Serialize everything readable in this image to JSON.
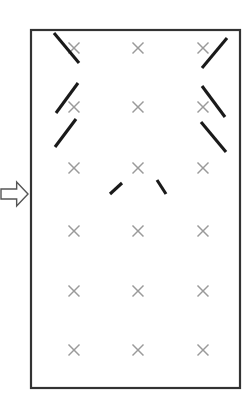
{
  "figure": {
    "title": "",
    "background_color": "#ffffff"
  },
  "frame": {
    "name": "panel-border",
    "x": 31,
    "y": 30,
    "width": 209,
    "height": 358,
    "stroke_color": "#333333",
    "fill_color": "#ffffff",
    "stroke_width": 2.2
  },
  "arrow": {
    "label": "",
    "direction": "right",
    "x": 1,
    "y": 182,
    "width": 27,
    "height": 24,
    "stroke_color": "#555555",
    "fill_color": "#ffffff"
  },
  "grid": {
    "columns": [
      74,
      138,
      203
    ],
    "rows": [
      48,
      107,
      168,
      231,
      291,
      350
    ],
    "marker_color": "#9a9a9a",
    "marker_size": 11,
    "marker_glyph": "x",
    "count": 18
  },
  "chart_data": {
    "type": "scatter",
    "title": "",
    "xlabel": "",
    "ylabel": "",
    "xlim": [
      31,
      240
    ],
    "ylim": [
      30,
      388
    ],
    "grid": false,
    "legend": "none",
    "series": [
      {
        "name": "grid-markers",
        "marker": "x",
        "color": "#9a9a9a",
        "points": [
          {
            "x": 74,
            "y": 48
          },
          {
            "x": 138,
            "y": 48
          },
          {
            "x": 203,
            "y": 48
          },
          {
            "x": 74,
            "y": 107
          },
          {
            "x": 138,
            "y": 107
          },
          {
            "x": 203,
            "y": 107
          },
          {
            "x": 74,
            "y": 168
          },
          {
            "x": 138,
            "y": 168
          },
          {
            "x": 203,
            "y": 168
          },
          {
            "x": 74,
            "y": 231
          },
          {
            "x": 138,
            "y": 231
          },
          {
            "x": 203,
            "y": 231
          },
          {
            "x": 74,
            "y": 291
          },
          {
            "x": 138,
            "y": 291
          },
          {
            "x": 203,
            "y": 291
          },
          {
            "x": 74,
            "y": 350
          },
          {
            "x": 138,
            "y": 350
          },
          {
            "x": 203,
            "y": 350
          }
        ]
      }
    ],
    "annotations": [
      {
        "name": "stroke-r1c1",
        "x1": 54,
        "y1": 33,
        "x2": 79,
        "y2": 63,
        "slope": "negative",
        "color": "#1a1a1a"
      },
      {
        "name": "stroke-r1c3-a",
        "x1": 202,
        "y1": 68,
        "x2": 227,
        "y2": 38,
        "slope": "positive",
        "color": "#1a1a1a"
      },
      {
        "name": "stroke-r2c1-a",
        "x1": 56,
        "y1": 113,
        "x2": 78,
        "y2": 83,
        "slope": "positive",
        "color": "#1a1a1a"
      },
      {
        "name": "stroke-r2c1-b",
        "x1": 55,
        "y1": 147,
        "x2": 76,
        "y2": 119,
        "slope": "positive",
        "color": "#1a1a1a"
      },
      {
        "name": "stroke-r2c3-a",
        "x1": 202,
        "y1": 86,
        "x2": 225,
        "y2": 117,
        "slope": "negative",
        "color": "#1a1a1a"
      },
      {
        "name": "stroke-r2c3-b",
        "x1": 201,
        "y1": 122,
        "x2": 226,
        "y2": 152,
        "slope": "negative",
        "color": "#1a1a1a"
      },
      {
        "name": "stroke-r3-left-short",
        "x1": 110,
        "y1": 194,
        "x2": 122,
        "y2": 183,
        "slope": "positive",
        "color": "#1a1a1a"
      },
      {
        "name": "stroke-r3-right-short",
        "x1": 157,
        "y1": 180,
        "x2": 166,
        "y2": 194,
        "slope": "negative",
        "color": "#1a1a1a"
      }
    ]
  }
}
